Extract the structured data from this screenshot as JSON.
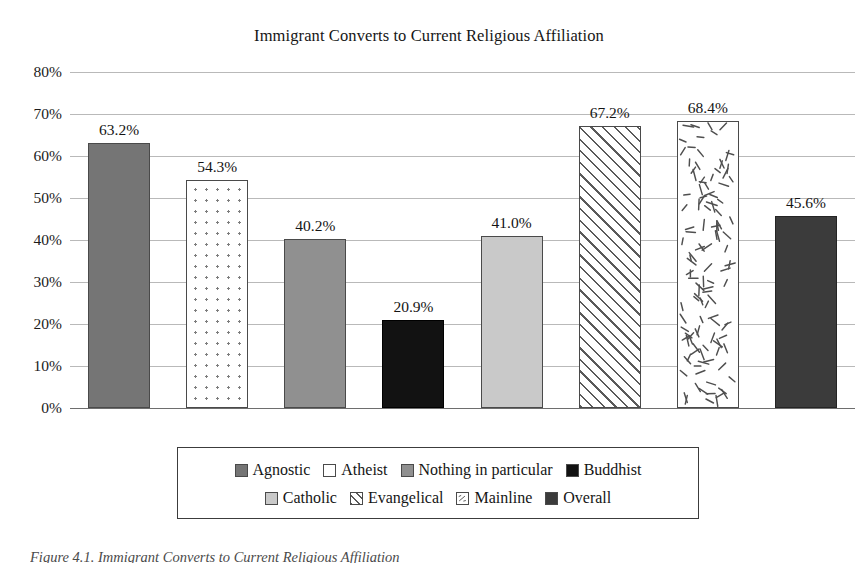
{
  "chart_data": {
    "type": "bar",
    "title": "Immigrant Converts to Current Religious Affiliation",
    "xlabel": "",
    "ylabel": "",
    "ylim": [
      0,
      80
    ],
    "ytick_labels": [
      "80%",
      "70%",
      "60%",
      "50%",
      "40%",
      "30%",
      "20%",
      "10%",
      "0%"
    ],
    "ytick_values": [
      80,
      70,
      60,
      50,
      40,
      30,
      20,
      10,
      0
    ],
    "grid": true,
    "legend_position": "bottom",
    "categories": [
      "Agnostic",
      "Atheist",
      "Nothing in particular",
      "Buddhist",
      "Catholic",
      "Evangelical",
      "Mainline",
      "Overall"
    ],
    "values": [
      63.2,
      54.3,
      40.2,
      20.9,
      41.0,
      67.2,
      68.4,
      45.6
    ],
    "data_labels": [
      "63.2%",
      "54.3%",
      "40.2%",
      "20.9%",
      "41.0%",
      "67.2%",
      "68.4%",
      "45.6%"
    ],
    "fills": [
      "solid-dark-gray",
      "white-dotted",
      "solid-medium-gray",
      "solid-black",
      "solid-light-gray",
      "diagonal-hatch",
      "white-dashes",
      "solid-charcoal"
    ],
    "colors": {
      "agnostic": "#757575",
      "atheist": "#ffffff",
      "nothing_in_particular": "#909090",
      "buddhist": "#121212",
      "catholic": "#c9c9c9",
      "evangelical": "#ffffff",
      "mainline": "#ffffff",
      "overall": "#3b3b3b",
      "gridline": "#b9b9b9",
      "axis": "#6e6e6e",
      "text": "#1c1c1c"
    }
  },
  "legend": {
    "row1": [
      {
        "label": "Agnostic",
        "fill": "solid-dark-gray"
      },
      {
        "label": "Atheist",
        "fill": "white-plain"
      },
      {
        "label": "Nothing in particular",
        "fill": "solid-medium-gray"
      },
      {
        "label": "Buddhist",
        "fill": "solid-black"
      }
    ],
    "row2": [
      {
        "label": "Catholic",
        "fill": "solid-light-gray"
      },
      {
        "label": "Evangelical",
        "fill": "diagonal-hatch"
      },
      {
        "label": "Mainline",
        "fill": "white-dashes"
      },
      {
        "label": "Overall",
        "fill": "solid-charcoal"
      }
    ]
  },
  "caption": "Figure 4.1. Immigrant Converts to Current Religious Affiliation"
}
